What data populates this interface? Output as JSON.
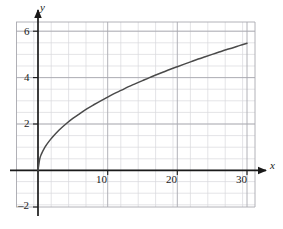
{
  "figure": {
    "kind": "graph",
    "background": "#ffffff"
  },
  "axes": {
    "x_axis_name": "x",
    "y_axis_name": "y",
    "x_ticks": [
      {
        "value": 10,
        "label": "10"
      },
      {
        "value": 20,
        "label": "20"
      },
      {
        "value": 30,
        "label": "30"
      }
    ],
    "y_ticks": [
      {
        "value": 6,
        "label": "6"
      },
      {
        "value": 4,
        "label": "4"
      },
      {
        "value": 2,
        "label": "2"
      },
      {
        "value": -2,
        "label": "–2"
      }
    ]
  },
  "colors": {
    "curve": "#4a4a4a",
    "axis": "#1a1a1a",
    "grid_minor": "#d8d8dc",
    "grid_major": "#a9a9b0",
    "text": "#1a1a1a"
  },
  "chart_data": {
    "type": "line",
    "title": "",
    "xlabel": "x",
    "ylabel": "y",
    "xlim": [
      -2,
      33
    ],
    "ylim": [
      -2.5,
      6.6
    ],
    "grid": true,
    "grid_minor_x_step": 2.5,
    "grid_minor_y_step": 0.5,
    "grid_major_x_step": 10,
    "grid_major_y_step": 2,
    "legend": "none",
    "series": [
      {
        "name": "y = sqrt(x)",
        "equation": "y = √x",
        "x": [
          0,
          0.25,
          0.5,
          1,
          1.5,
          2,
          3,
          4,
          5,
          6,
          7,
          8,
          9,
          10,
          11,
          12,
          13,
          14,
          15,
          16,
          17,
          18,
          19,
          20,
          21,
          22,
          23,
          24,
          25,
          26,
          27,
          28,
          29,
          30
        ],
        "y": [
          0,
          0.5,
          0.71,
          1,
          1.22,
          1.41,
          1.73,
          2,
          2.24,
          2.45,
          2.65,
          2.83,
          3,
          3.16,
          3.32,
          3.46,
          3.61,
          3.74,
          3.87,
          4,
          4.12,
          4.24,
          4.36,
          4.47,
          4.58,
          4.69,
          4.8,
          4.9,
          5,
          5.1,
          5.2,
          5.29,
          5.39,
          5.48
        ]
      }
    ]
  }
}
